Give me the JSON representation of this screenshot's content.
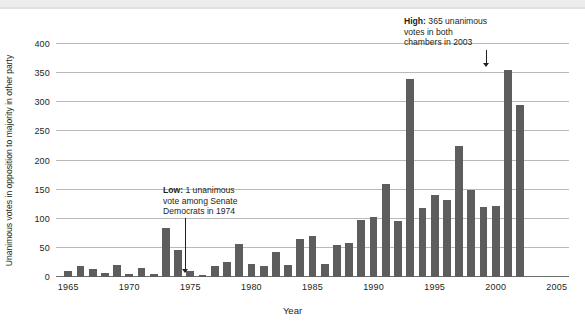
{
  "chart_data": {
    "type": "bar",
    "title": "",
    "xlabel": "Year",
    "ylabel": "Unanimous votes in opposition to majority in other party",
    "ylim": [
      0,
      400
    ],
    "yticks": [
      0,
      50,
      100,
      150,
      200,
      250,
      300,
      350,
      400
    ],
    "xticks": [
      1965,
      1970,
      1975,
      1980,
      1985,
      1990,
      1995,
      2000,
      2005
    ],
    "xlim": [
      1964,
      2006
    ],
    "grid": true,
    "legend": null,
    "bar_color": "#5d5d5d",
    "categories": [
      1965,
      1966,
      1967,
      1968,
      1969,
      1970,
      1971,
      1972,
      1973,
      1974,
      1975,
      1976,
      1977,
      1978,
      1979,
      1980,
      1981,
      1982,
      1983,
      1984,
      1985,
      1986,
      1987,
      1988,
      1989,
      1990,
      1991,
      1992,
      1993,
      1994,
      1995,
      1996,
      1997,
      1998,
      1999,
      2000,
      2001,
      2002,
      2003,
      2004,
      2005
    ],
    "values": [
      10,
      19,
      14,
      7,
      20,
      6,
      15,
      5,
      84,
      46,
      11,
      3,
      19,
      26,
      56,
      23,
      19,
      43,
      20,
      65,
      70,
      22,
      55,
      58,
      98,
      103,
      160,
      96,
      340,
      119,
      140,
      132,
      225,
      150,
      120,
      122,
      356,
      296,
      0,
      0,
      0
    ],
    "annotations": [
      {
        "id": "high",
        "bold_prefix": "High:",
        "lines": [
          "365 unanimous",
          "votes in both",
          "chambers in 2003"
        ],
        "value": 365,
        "year": 2003
      },
      {
        "id": "low",
        "bold_prefix": "Low:",
        "lines": [
          "1 unanimous",
          "vote among Senate",
          "Democrats in 1974"
        ],
        "value": 1,
        "year": 1974
      }
    ]
  },
  "axis": {
    "ylabel": "Unanimous votes in opposition to majority in other party",
    "xlabel": "Year"
  }
}
